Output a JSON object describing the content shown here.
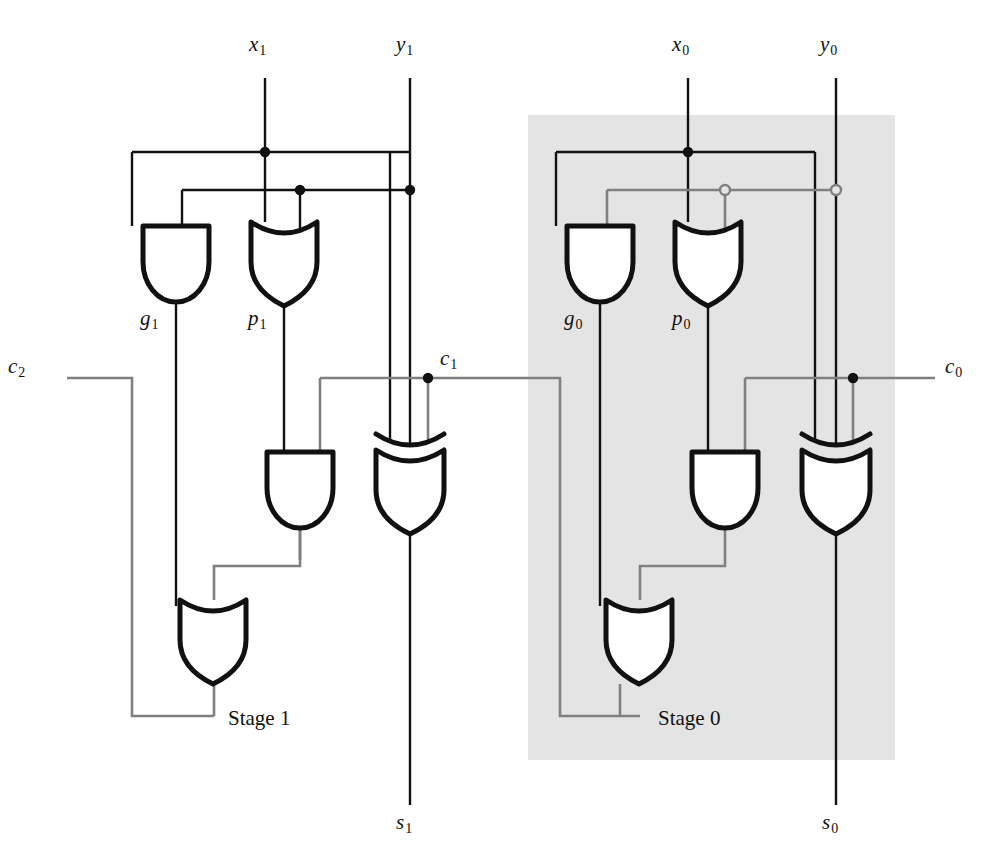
{
  "figure": {
    "type": "logic-circuit-diagram",
    "background": "#ffffff",
    "wire_color_black": "#111111",
    "wire_color_gray": "#808080",
    "shade_color": "#e4e4e4"
  },
  "labels": {
    "x1": "x",
    "x1_sub": "1",
    "y1": "y",
    "y1_sub": "1",
    "x0": "x",
    "x0_sub": "0",
    "y0": "y",
    "y0_sub": "0",
    "g1": "g",
    "g1_sub": "1",
    "p1": "p",
    "p1_sub": "1",
    "g0": "g",
    "g0_sub": "0",
    "p0": "p",
    "p0_sub": "0",
    "c2": "c",
    "c2_sub": "2",
    "c1": "c",
    "c1_sub": "1",
    "c0": "c",
    "c0_sub": "0",
    "s1": "s",
    "s1_sub": "1",
    "s0": "s",
    "s0_sub": "0",
    "stage1": "Stage 1",
    "stage0": "Stage 0"
  },
  "inputs": [
    {
      "name": "x1",
      "x": 265,
      "y_top": 78,
      "label_x": 250,
      "label_y": 40
    },
    {
      "name": "y1",
      "x": 410,
      "y_top": 78,
      "label_x": 396,
      "label_y": 40
    },
    {
      "name": "x0",
      "x": 688,
      "y_top": 78,
      "label_x": 673,
      "label_y": 40
    },
    {
      "name": "y0",
      "x": 836,
      "y_top": 78,
      "label_x": 820,
      "label_y": 40
    }
  ],
  "outputs": [
    {
      "name": "s1",
      "x": 410,
      "y_bottom": 805,
      "label_x": 396,
      "label_y": 812
    },
    {
      "name": "s0",
      "x": 836,
      "y_bottom": 805,
      "label_x": 822,
      "label_y": 812
    }
  ],
  "carries": [
    {
      "name": "c2",
      "x": 67,
      "y": 378,
      "label_x": 8,
      "label_y": 358,
      "side": "left"
    },
    {
      "name": "c1",
      "x": 428,
      "y": 378,
      "label_x": 440,
      "label_y": 350,
      "side": "right"
    },
    {
      "name": "c0",
      "x": 853,
      "y": 378,
      "label_x": 945,
      "label_y": 358,
      "side": "right"
    }
  ],
  "gates": [
    {
      "id": "and-g1",
      "type": "AND",
      "stage": 1,
      "output_label": "g1",
      "x": 143,
      "y": 226,
      "w": 66,
      "h": 76
    },
    {
      "id": "or-p1",
      "type": "OR",
      "stage": 1,
      "output_label": "p1",
      "x": 251,
      "y": 222,
      "w": 66,
      "h": 84
    },
    {
      "id": "and-mid1",
      "type": "AND",
      "stage": 1,
      "output_label": "",
      "x": 268,
      "y": 452,
      "w": 64,
      "h": 78
    },
    {
      "id": "xor-s1",
      "type": "XOR",
      "stage": 1,
      "output_label": "s1",
      "x": 376,
      "y": 434,
      "w": 68,
      "h": 100
    },
    {
      "id": "or-c2",
      "type": "OR",
      "stage": 1,
      "output_label": "c2",
      "x": 161,
      "y": 600,
      "w": 68,
      "h": 84
    },
    {
      "id": "and-g0",
      "type": "AND",
      "stage": 0,
      "output_label": "g0",
      "x": 567,
      "y": 226,
      "w": 66,
      "h": 76
    },
    {
      "id": "or-p0",
      "type": "OR",
      "stage": 0,
      "output_label": "p0",
      "x": 675,
      "y": 222,
      "w": 66,
      "h": 84
    },
    {
      "id": "and-mid0",
      "type": "AND",
      "stage": 0,
      "output_label": "",
      "x": 693,
      "y": 452,
      "w": 64,
      "h": 78
    },
    {
      "id": "xor-s0",
      "type": "XOR",
      "stage": 0,
      "output_label": "s0",
      "x": 802,
      "y": 434,
      "w": 68,
      "h": 100
    },
    {
      "id": "or-c1",
      "type": "OR",
      "stage": 0,
      "output_label": "c1",
      "x": 586,
      "y": 600,
      "w": 68,
      "h": 84
    }
  ],
  "shaded_region": {
    "x": 528,
    "y": 115,
    "width": 367,
    "height": 645
  },
  "stage_labels": [
    {
      "text": "Stage 1",
      "x": 230,
      "y": 718
    },
    {
      "text": "Stage 0",
      "x": 660,
      "y": 718
    }
  ],
  "junctions": [
    {
      "x": 265,
      "y": 152,
      "filled": true
    },
    {
      "x": 300,
      "y": 190,
      "filled": true
    },
    {
      "x": 410,
      "y": 190,
      "filled": true
    },
    {
      "x": 428,
      "y": 378,
      "filled": true
    },
    {
      "x": 688,
      "y": 152,
      "filled": true
    },
    {
      "x": 725,
      "y": 190,
      "filled": false
    },
    {
      "x": 836,
      "y": 190,
      "filled": false
    },
    {
      "x": 853,
      "y": 378,
      "filled": true
    }
  ]
}
